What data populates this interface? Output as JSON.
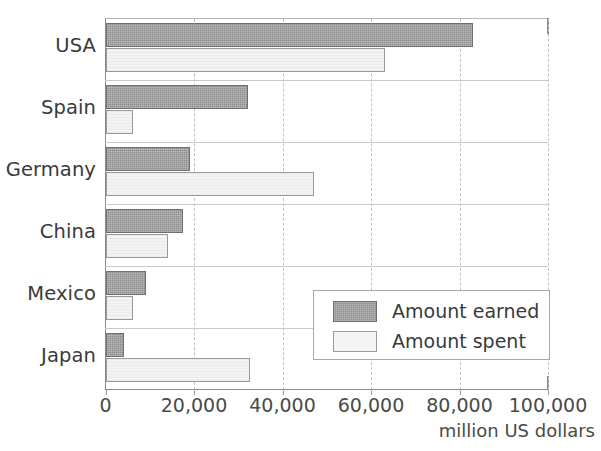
{
  "chart_data": {
    "type": "bar",
    "orientation": "horizontal",
    "title": "",
    "xlabel": "million US dollars",
    "ylabel": "",
    "xlim": [
      0,
      100000
    ],
    "xticks": [
      0,
      20000,
      40000,
      60000,
      80000,
      100000
    ],
    "xtick_labels": [
      "0",
      "20,000",
      "40,000",
      "60,000",
      "80,000",
      "100,000"
    ],
    "grid": "vertical-dashed",
    "legend_position": "inside-lower-right",
    "categories": [
      "USA",
      "Spain",
      "Germany",
      "China",
      "Mexico",
      "Japan"
    ],
    "series": [
      {
        "name": "Amount earned",
        "color": "#8d8d8d",
        "values": [
          83000,
          32000,
          19000,
          17500,
          9000,
          4000
        ]
      },
      {
        "name": "Amount spent",
        "color": "#f3f3f3",
        "values": [
          63000,
          6000,
          47000,
          14000,
          6000,
          32500
        ]
      }
    ]
  },
  "legend": {
    "entries": [
      {
        "label": "Amount earned",
        "swatch": "earned"
      },
      {
        "label": "Amount spent",
        "swatch": "spent"
      }
    ]
  },
  "axis": {
    "unit_label": "million US dollars"
  }
}
